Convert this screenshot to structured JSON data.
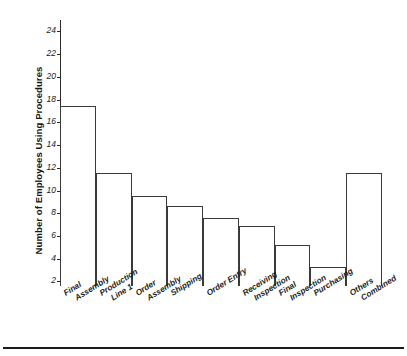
{
  "chart_data": {
    "type": "bar",
    "title": "",
    "xlabel": "",
    "ylabel": "Number of Employees Using Procedures",
    "categories": [
      "Final Assembly",
      "Production Line 1",
      "Order Assembly",
      "Shipping",
      "Order Entry",
      "Receiving Inspection",
      "Final Inspection",
      "Purchasing",
      "Others Combined"
    ],
    "category_lines": [
      [
        "Final",
        "Assembly"
      ],
      [
        "Production",
        "Line 1"
      ],
      [
        "Order",
        "Assembly"
      ],
      [
        "Shipping"
      ],
      [
        "Order Entry"
      ],
      [
        "Receiving",
        "Inspection"
      ],
      [
        "Final",
        "Inspection"
      ],
      [
        "Purchasing"
      ],
      [
        "Others",
        "Combined"
      ]
    ],
    "values": [
      17.4,
      11.5,
      9.5,
      8.6,
      7.6,
      6.9,
      5.2,
      3.3,
      11.5
    ],
    "ylim": [
      1.6,
      25.0
    ],
    "yticks": [
      2,
      4,
      6,
      8,
      10,
      12,
      14,
      16,
      18,
      20,
      22,
      24
    ],
    "ytick_labels": [
      "2",
      "4",
      "6",
      "8",
      "10",
      "12",
      "14",
      "16",
      "18",
      "20",
      "22",
      "24"
    ],
    "grid": false,
    "legend": false,
    "legend_position": "none",
    "bar_fill_color": "#ffffff",
    "bar_edge_color": "#3a3a3a",
    "axis_color": "#2b2b2b",
    "background_color": "#ffffff"
  }
}
